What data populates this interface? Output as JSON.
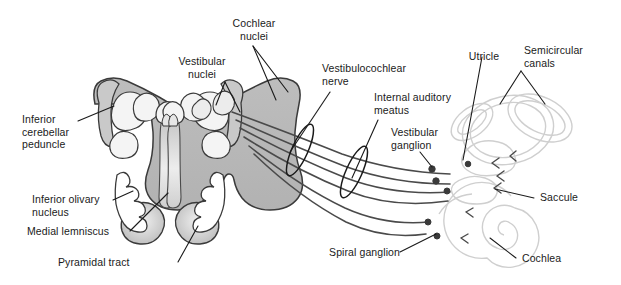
{
  "figure": {
    "background_color": "#ffffff",
    "width": 621,
    "height": 285
  },
  "palette": {
    "label_text": "#1a1a1a",
    "leader_line": "#1a1a1a",
    "nerve_fiber": "#4a4a4a",
    "brainstem_fill": "#b8b8b8",
    "brainstem_fill_light": "#d2d2d2",
    "brainstem_outline": "#3a3a3a",
    "nucleus_white": "#f4f4f4",
    "peduncle_fill": "#c9c9c9",
    "inner_ear_outline": "#cfcfcf",
    "ganglion_dark": "#3a3a3a"
  },
  "labels": {
    "cochlear_nuclei": "Cochlear\nnuclei",
    "vestibular_nuclei": "Vestibular\nnuclei",
    "vestibulocochlear_nerve": "Vestibulocochlear\nnerve",
    "internal_auditory_meatus": "Internal auditory\nmeatus",
    "vestibular_ganglion": "Vestibular\nganglion",
    "utricle": "Utricle",
    "semicircular_canals": "Semicircular\ncanals",
    "saccule": "Saccule",
    "cochlea": "Cochlea",
    "spiral_ganglion": "Spiral ganglion",
    "inferior_cerebellar_peduncle": "Inferior\ncerebellar\npeduncle",
    "inferior_olivary_nucleus": "Inferior olivary\nnucleus",
    "medial_lemniscus": "Medial lemniscus",
    "pyramidal_tract": "Pyramidal tract"
  },
  "structures": {
    "brainstem": "medulla-cross-section",
    "cochlea": "spiral-cochlea",
    "semicircular_canals": "three-canal-loops",
    "utricle": "utricle-sac",
    "saccule": "saccule-sac",
    "meatus_rings": 2,
    "ganglion_markers": 6
  }
}
